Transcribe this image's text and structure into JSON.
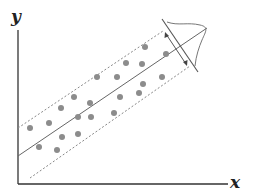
{
  "diagram": {
    "axes": {
      "x_label": "x",
      "y_label": "y"
    },
    "colors": {
      "axis": "#333333",
      "line": "#666666",
      "dashed": "#888888",
      "points": "#8c8c8c",
      "curve": "#777777"
    },
    "points": [
      [
        30,
        128
      ],
      [
        49,
        123
      ],
      [
        39,
        147
      ],
      [
        57,
        150
      ],
      [
        62,
        137
      ],
      [
        78,
        134
      ],
      [
        61,
        108
      ],
      [
        74,
        97
      ],
      [
        78,
        117
      ],
      [
        90,
        103
      ],
      [
        91,
        117
      ],
      [
        97,
        77
      ],
      [
        117,
        77
      ],
      [
        120,
        97
      ],
      [
        114,
        113
      ],
      [
        126,
        63
      ],
      [
        142,
        64
      ],
      [
        143,
        84
      ],
      [
        139,
        93
      ],
      [
        145,
        47
      ],
      [
        166,
        54
      ],
      [
        162,
        77
      ]
    ]
  }
}
